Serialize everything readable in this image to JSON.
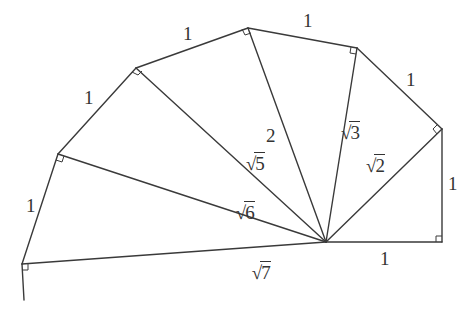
{
  "diagram": {
    "center": [
      326,
      242
    ],
    "outer_vertices": [
      [
        442,
        242
      ],
      [
        442,
        129
      ],
      [
        357,
        48
      ],
      [
        248,
        28
      ],
      [
        136,
        68
      ],
      [
        58,
        154
      ],
      [
        22,
        264
      ]
    ],
    "tail_end": [
      24,
      300
    ],
    "unit_labels": [
      "1",
      "1",
      "1",
      "1",
      "1",
      "1",
      "1"
    ],
    "hypotenuse_labels": [
      {
        "radicand": "2",
        "sqrt": true
      },
      {
        "radicand": "3",
        "sqrt": true
      },
      {
        "radicand": "2",
        "sqrt": false
      },
      {
        "radicand": "5",
        "sqrt": true
      },
      {
        "radicand": "6",
        "sqrt": true
      },
      {
        "radicand": "7",
        "sqrt": true
      }
    ],
    "colors": {
      "stroke": "#3a3a3a",
      "text": "#333333",
      "background": "#ffffff"
    }
  }
}
